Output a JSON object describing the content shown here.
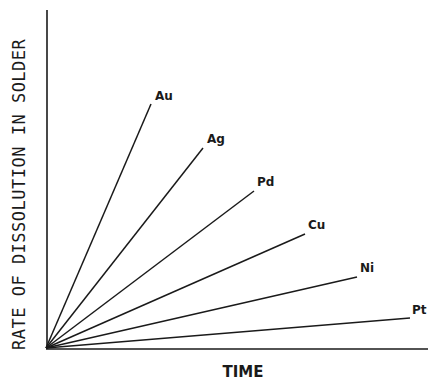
{
  "chart_data": {
    "type": "line",
    "title": "",
    "xlabel": "TIME",
    "ylabel": "RATE OF DISSOLUTION IN SOLDER",
    "grid": false,
    "legend": "inline labels at line ends",
    "x": [
      0,
      1
    ],
    "series": [
      {
        "name": "Au",
        "values": [
          0,
          0.72
        ]
      },
      {
        "name": "Ag",
        "values": [
          0,
          0.59
        ]
      },
      {
        "name": "Pd",
        "values": [
          0,
          0.46
        ]
      },
      {
        "name": "Cu",
        "values": [
          0,
          0.34
        ]
      },
      {
        "name": "Ni",
        "values": [
          0,
          0.21
        ]
      },
      {
        "name": "Pt",
        "values": [
          0,
          0.09
        ]
      }
    ],
    "plot": {
      "origin": [
        46,
        348
      ],
      "y_axis_top": [
        47,
        10
      ],
      "x_axis_end": [
        428,
        349
      ],
      "endpoints": [
        {
          "name": "Au",
          "x": 151,
          "y": 104,
          "label_x": 155,
          "label_y": 100
        },
        {
          "name": "Ag",
          "x": 203,
          "y": 148,
          "label_x": 207,
          "label_y": 143
        },
        {
          "name": "Pd",
          "x": 254,
          "y": 191,
          "label_x": 257,
          "label_y": 186
        },
        {
          "name": "Cu",
          "x": 305,
          "y": 234,
          "label_x": 308,
          "label_y": 229
        },
        {
          "name": "Ni",
          "x": 357,
          "y": 277,
          "label_x": 360,
          "label_y": 272
        },
        {
          "name": "Pt",
          "x": 410,
          "y": 318,
          "label_x": 412,
          "label_y": 314
        }
      ]
    },
    "colors": {
      "line": "#1a1a1a",
      "background": "#ffffff"
    }
  }
}
